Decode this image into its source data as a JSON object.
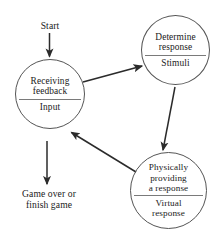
{
  "diagram": {
    "background_color": "#ffffff",
    "stroke_color": "#3a3a3a",
    "node_border_color": "#555555",
    "divider_color": "#7a7a7a",
    "text_color": "#1a1a1a",
    "labels": {
      "start": "Start",
      "game_over_line1": "Game over or",
      "game_over_line2": "finish game"
    },
    "nodes": [
      {
        "id": "receiving-feedback",
        "top_text": "Receiving\nfeedback",
        "top_line1": "Receiving",
        "top_line2": "feedback",
        "bottom_text": "Input"
      },
      {
        "id": "determine-response",
        "top_text": "Determine\nresponse",
        "top_line1": "Determine",
        "top_line2": "response",
        "bottom_text": "Stimuli"
      },
      {
        "id": "physically-providing-a-response",
        "top_text": "Physically\nproviding\na response",
        "top_line1": "Physically",
        "top_line2": "providing",
        "top_line3": "a response",
        "bottom_line1": "Virtual",
        "bottom_line2": "response"
      }
    ],
    "arrows": [
      {
        "id": "start-to-receiving",
        "from": "Start",
        "to": "Receiving feedback"
      },
      {
        "id": "receiving-to-determine",
        "from": "Receiving feedback",
        "to": "Determine response"
      },
      {
        "id": "determine-to-physical",
        "from": "Determine response",
        "to": "Physically providing a response"
      },
      {
        "id": "physical-to-receiving",
        "from": "Physically providing a response",
        "to": "Receiving feedback"
      },
      {
        "id": "receiving-to-game-over",
        "from": "Receiving feedback",
        "to": "Game over or finish game"
      }
    ]
  }
}
